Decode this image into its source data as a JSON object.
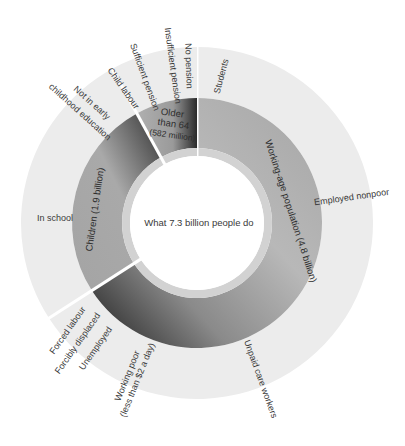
{
  "chart_data": {
    "type": "sunburst",
    "title": "What 7.3 billion people do",
    "total_billion": 7.3,
    "inner_ring": [
      {
        "name": "Working-age population (4.8 billion)",
        "value_billion": 4.8
      },
      {
        "name": "Children (1.9 billion)",
        "value_billion": 1.9
      },
      {
        "name": "Older than 64 (582 million)",
        "value_billion": 0.582
      }
    ],
    "outer_ring": {
      "Working-age population": [
        "Students",
        "Employed nonpoor",
        "Unpaid care workers",
        "Working poor (less than $2 a day)",
        "Unemployed",
        "Forcibly displaced",
        "Forced labour"
      ],
      "Children": [
        "In school",
        "Not in early childhood education",
        "Child labour"
      ],
      "Older than 64": [
        "Sufficient pension",
        "Insufficient pension",
        "No pension"
      ]
    },
    "labels": {
      "center": "What 7.3 billion people do",
      "working_age": "Working-age population (4.8 billion)",
      "children": "Children (1.9 billion)",
      "older_l1": "Older",
      "older_l2": "than 64",
      "older_l3": "(582 million)",
      "students": "Students",
      "employed_nonpoor": "Employed nonpoor",
      "unpaid_care": "Unpaid care workers",
      "working_poor_l1": "Working poor",
      "working_poor_l2": "(less than $2 a day)",
      "unemployed": "Unemployed",
      "forcibly_displaced": "Forcibly displaced",
      "forced_labour": "Forced labour",
      "in_school": "In school",
      "not_early_l1": "Not in early",
      "not_early_l2": "childhood education",
      "child_labour": "Child labour",
      "sufficient_pension": "Sufficient pension",
      "insufficient_pension": "Insufficient pension",
      "no_pension": "No pension"
    },
    "colors": {
      "outer": "#ececec",
      "middle": "#a9a9a9",
      "band": "#d2d2d2",
      "dark": "#2a2a2a",
      "text": "#3a3a3a"
    }
  }
}
